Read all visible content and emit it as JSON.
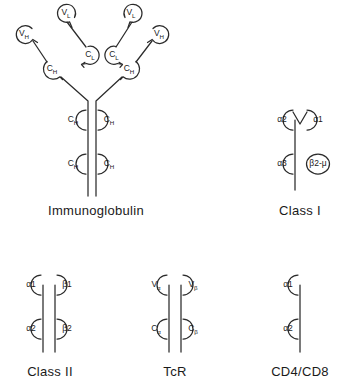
{
  "figure": {
    "background_color": "#ffffff",
    "stroke_color": "#2b2b2b"
  },
  "panels": [
    {
      "id": "immunoglobulin",
      "caption": "Immunoglobulin",
      "caption_x": 96,
      "caption_y": 211,
      "domains": [
        {
          "name": "V",
          "sub": "L",
          "cx": 67,
          "cy": 13
        },
        {
          "name": "V",
          "sub": "H",
          "cx": 25,
          "cy": 34
        },
        {
          "name": "C",
          "sub": "L",
          "cx": 91,
          "cy": 55
        },
        {
          "name": "C",
          "sub": "H",
          "cx": 53,
          "cy": 69
        },
        {
          "name": "V",
          "sub": "L",
          "cx": 132,
          "cy": 13
        },
        {
          "name": "V",
          "sub": "H",
          "cx": 160,
          "cy": 34
        },
        {
          "name": "C",
          "sub": "L",
          "cx": 113,
          "cy": 55
        },
        {
          "name": "C",
          "sub": "H",
          "cx": 128,
          "cy": 69
        },
        {
          "name": "C",
          "sub": "H",
          "cx": 74,
          "cy": 120
        },
        {
          "name": "C",
          "sub": "H",
          "cx": 108,
          "cy": 120
        },
        {
          "name": "C",
          "sub": "H",
          "cx": 74,
          "cy": 164
        },
        {
          "name": "C",
          "sub": "H",
          "cx": 108,
          "cy": 164
        }
      ]
    },
    {
      "id": "class-i",
      "caption": "Class  I",
      "caption_x": 300,
      "caption_y": 211,
      "domains": [
        {
          "name": "α2",
          "sub": "",
          "cx": 283,
          "cy": 120
        },
        {
          "name": "α1",
          "sub": "",
          "cx": 317,
          "cy": 120
        },
        {
          "name": "α3",
          "sub": "",
          "cx": 283,
          "cy": 164
        },
        {
          "name": "β2-μ",
          "sub": "",
          "cx": 317,
          "cy": 164
        }
      ]
    },
    {
      "id": "class-ii",
      "caption": "Class II",
      "caption_x": 50,
      "caption_y": 372,
      "domains": [
        {
          "name": "α1",
          "sub": "",
          "cx": 32,
          "cy": 285
        },
        {
          "name": "β1",
          "sub": "",
          "cx": 66,
          "cy": 285
        },
        {
          "name": "α2",
          "sub": "",
          "cx": 32,
          "cy": 329
        },
        {
          "name": "β2",
          "sub": "",
          "cx": 66,
          "cy": 329
        }
      ]
    },
    {
      "id": "tcr",
      "caption": "TcR",
      "caption_x": 175,
      "caption_y": 372,
      "domains": [
        {
          "name": "V",
          "sub": "α",
          "cx": 158,
          "cy": 285
        },
        {
          "name": "V",
          "sub": "β",
          "cx": 192,
          "cy": 285
        },
        {
          "name": "C",
          "sub": "α",
          "cx": 158,
          "cy": 329
        },
        {
          "name": "C",
          "sub": "β",
          "cx": 192,
          "cy": 329
        }
      ]
    },
    {
      "id": "cd4-cd8",
      "caption": "CD4/CD8",
      "caption_x": 300,
      "caption_y": 372,
      "domains": [
        {
          "name": "α1",
          "sub": "",
          "cx": 289,
          "cy": 285
        },
        {
          "name": "α2",
          "sub": "",
          "cx": 289,
          "cy": 329
        }
      ]
    }
  ]
}
